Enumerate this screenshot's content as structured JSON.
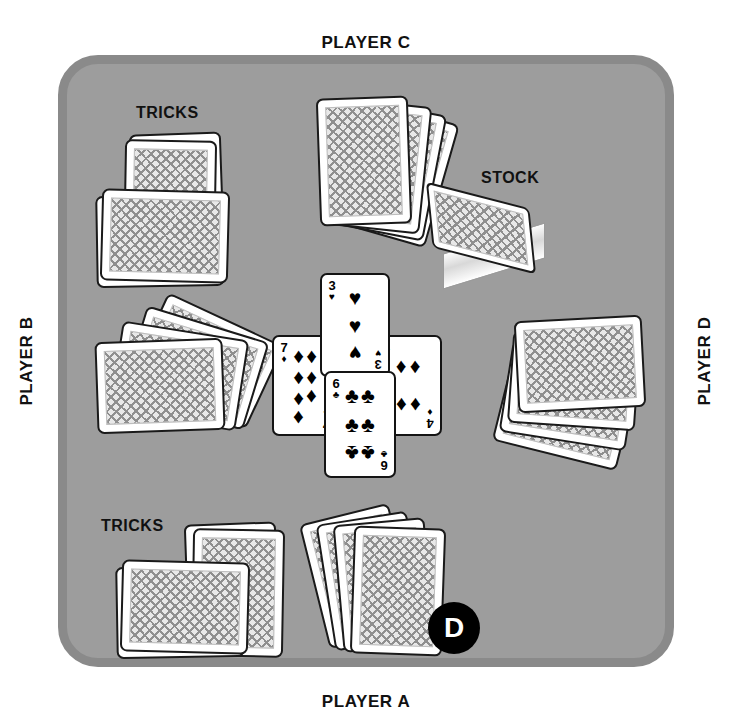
{
  "diagram": {
    "table_color": "#9d9d9d",
    "table_rim_color": "#8a8a8a"
  },
  "labels": {
    "player_c": "PLAYER C",
    "player_a": "PLAYER A",
    "player_b": "PLAYER B",
    "player_d": "PLAYER D",
    "tricks_b": "TRICKS",
    "tricks_a": "TRICKS",
    "stock": "STOCK"
  },
  "dealer_button": {
    "label": "D",
    "belongs_to": "PLAYER A",
    "color": "#000000",
    "text_color": "#ffffff"
  },
  "trick_cards": [
    {
      "rank": "3",
      "suit": "hearts",
      "symbol": "♥",
      "position": "north",
      "pip_count": 3
    },
    {
      "rank": "7",
      "suit": "diamonds",
      "symbol": "♦",
      "position": "west",
      "pip_count": 7
    },
    {
      "rank": "4",
      "suit": "diamonds",
      "symbol": "♦",
      "position": "east",
      "pip_count": 4
    },
    {
      "rank": "6",
      "suit": "clubs",
      "symbol": "♣",
      "position": "south",
      "pip_count": 6
    }
  ],
  "hands": [
    {
      "player": "PLAYER A",
      "cards": 4,
      "face": "down"
    },
    {
      "player": "PLAYER B",
      "cards": 4,
      "face": "down"
    },
    {
      "player": "PLAYER C",
      "cards": 4,
      "face": "down"
    },
    {
      "player": "PLAYER D",
      "cards": 4,
      "face": "down"
    }
  ],
  "tricks_piles": [
    {
      "player": "PLAYER B",
      "stacks": 2
    },
    {
      "player": "PLAYER A",
      "stacks": 2
    }
  ],
  "stock_pile": {
    "face": "down",
    "shape": "block"
  }
}
